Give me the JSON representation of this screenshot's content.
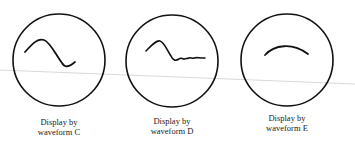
{
  "displays": [
    {
      "id": "C",
      "line1": "Display by",
      "line2": "waveform C",
      "trace": "single-hump-then-dip"
    },
    {
      "id": "D",
      "line1": "Display by",
      "line2": "waveform D",
      "trace": "hump-then-damped-ripple"
    },
    {
      "id": "E",
      "line1": "Display by",
      "line2": "waveform E",
      "trace": "arc"
    }
  ],
  "colors": {
    "stroke": "#111111",
    "guide_line": "#c8c8c8",
    "text": "#222222"
  }
}
